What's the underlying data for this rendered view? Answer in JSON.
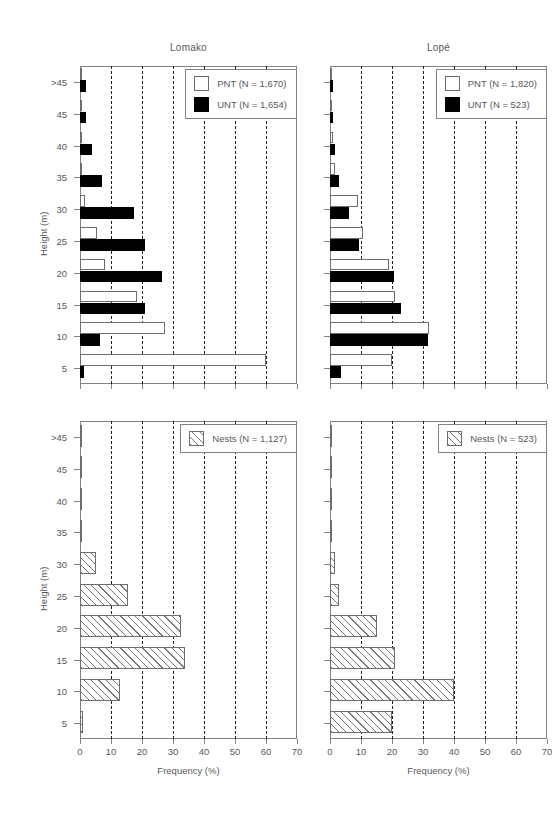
{
  "figure": {
    "xlabel": "Frequency (%)",
    "ylabel": "Height (m)",
    "panel_titles": [
      "Lomako",
      "Lopé"
    ],
    "colors": {
      "axis": "#808285",
      "text": "#58595b",
      "unt_fill": "#000000",
      "pnt_fill": "#ffffff",
      "nest_hatch": "#6d6e71"
    }
  },
  "axes": {
    "x": {
      "min": 0,
      "max": 70,
      "ticks": [
        0,
        10,
        20,
        30,
        40,
        50,
        60,
        70
      ],
      "tick_labels": [
        "0",
        "10",
        "20",
        "30",
        "40",
        "50",
        "60",
        "70"
      ],
      "grid": true,
      "grid_style": "dashed"
    },
    "y": {
      "categories": [
        "5",
        "10",
        "15",
        "20",
        "25",
        "30",
        "35",
        "40",
        "45",
        ">45"
      ],
      "tick_labels": [
        "5",
        "10",
        "15",
        "20",
        "25",
        "30",
        "35",
        "40",
        "45",
        ">45"
      ]
    }
  },
  "chart_data": [
    {
      "id": "lomako-trees",
      "type": "bar",
      "orientation": "horizontal",
      "title": "Lomako",
      "xlabel": "Frequency (%)",
      "ylabel": "Height (m)",
      "xlim": [
        0,
        70
      ],
      "categories": [
        "5",
        "10",
        "15",
        "20",
        "25",
        "30",
        "35",
        "40",
        "45",
        ">45"
      ],
      "series": [
        {
          "name": "PNT (N = 1,670)",
          "style": "open",
          "values": [
            60.0,
            27.5,
            18.5,
            8.0,
            5.5,
            1.5,
            0.6,
            0.5,
            0.4,
            0.3
          ]
        },
        {
          "name": "UNT (N = 1,654)",
          "style": "filled",
          "values": [
            1.2,
            6.5,
            21.0,
            26.5,
            21.0,
            17.5,
            7.0,
            4.0,
            2.0,
            2.0
          ]
        }
      ],
      "legend": {
        "position": "top-right",
        "entries": [
          "PNT (N = 1,670)",
          "UNT (N = 1,654)"
        ]
      }
    },
    {
      "id": "lope-trees",
      "type": "bar",
      "orientation": "horizontal",
      "title": "Lopé",
      "xlabel": "Frequency (%)",
      "ylabel": "Height (m)",
      "xlim": [
        0,
        70
      ],
      "categories": [
        "5",
        "10",
        "15",
        "20",
        "25",
        "30",
        "35",
        "40",
        "45",
        ">45"
      ],
      "series": [
        {
          "name": "PNT (N = 1,820)",
          "style": "open",
          "values": [
            20.0,
            32.0,
            21.0,
            19.0,
            10.5,
            9.0,
            1.5,
            1.0,
            0.8,
            0.8
          ]
        },
        {
          "name": "UNT (N = 523)",
          "style": "filled",
          "values": [
            3.5,
            31.5,
            23.0,
            20.5,
            9.5,
            6.0,
            3.0,
            1.5,
            1.0,
            1.0
          ]
        }
      ],
      "legend": {
        "position": "top-right",
        "entries": [
          "PNT (N = 1,820)",
          "UNT (N = 523)"
        ]
      }
    },
    {
      "id": "lomako-nests",
      "type": "bar",
      "orientation": "horizontal",
      "title": "Lomako",
      "xlabel": "Frequency (%)",
      "ylabel": "Height (m)",
      "xlim": [
        0,
        70
      ],
      "categories": [
        "5",
        "10",
        "15",
        "20",
        "25",
        "30",
        "35",
        "40",
        "45",
        ">45"
      ],
      "series": [
        {
          "name": "Nests (N = 1,127)",
          "style": "hatched",
          "values": [
            1.0,
            13.0,
            34.0,
            32.5,
            15.5,
            5.0,
            0.8,
            0.8,
            0.8,
            0.8
          ]
        }
      ],
      "legend": {
        "position": "top-right",
        "entries": [
          "Nests (N = 1,127)"
        ]
      }
    },
    {
      "id": "lope-nests",
      "type": "bar",
      "orientation": "horizontal",
      "title": "Lopé",
      "xlabel": "Frequency (%)",
      "ylabel": "Height (m)",
      "xlim": [
        0,
        70
      ],
      "categories": [
        "5",
        "10",
        "15",
        "20",
        "25",
        "30",
        "35",
        "40",
        "45",
        ">45"
      ],
      "series": [
        {
          "name": "Nests (N = 523)",
          "style": "hatched",
          "values": [
            20.0,
            40.0,
            21.0,
            15.0,
            3.0,
            1.5,
            0.0,
            0.0,
            0.0,
            0.0
          ]
        }
      ],
      "legend": {
        "position": "top-right",
        "entries": [
          "Nests (N = 523)"
        ]
      }
    }
  ]
}
